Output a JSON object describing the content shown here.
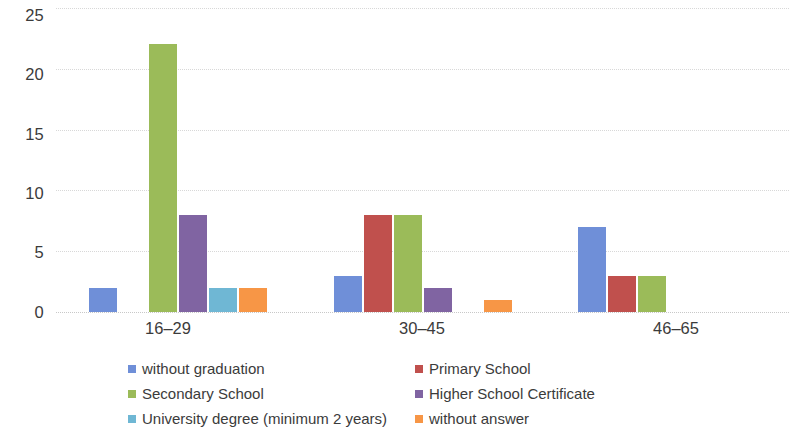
{
  "chart_data": {
    "type": "bar",
    "title": "",
    "subtitle": "",
    "xlabel": "",
    "ylabel": "",
    "categories": [
      "16–29",
      "30–45",
      "46–65"
    ],
    "ylim": [
      0,
      25
    ],
    "yticks": [
      0,
      5,
      10,
      15,
      20,
      25
    ],
    "ytick_labels": [
      "0",
      "5",
      "10",
      "15",
      "20",
      "25"
    ],
    "grid": true,
    "grid_axis": "y",
    "legend_position": "bottom",
    "series": [
      {
        "name": "without graduation",
        "color": "#6f8fd8",
        "values": [
          2,
          3,
          7
        ]
      },
      {
        "name": "Primary School",
        "color": "#c0504d",
        "values": [
          0,
          8,
          3
        ]
      },
      {
        "name": "Secondary School",
        "color": "#9bbb59",
        "values": [
          22,
          8,
          3
        ]
      },
      {
        "name": "Higher School Certificate",
        "color": "#8064a2",
        "values": [
          8,
          2,
          0
        ]
      },
      {
        "name": "University degree (minimum 2 years)",
        "color": "#6fb7d4",
        "values": [
          2,
          0,
          0
        ]
      },
      {
        "name": "without answer",
        "color": "#f79646",
        "values": [
          2,
          1,
          0
        ]
      }
    ]
  },
  "axis": {
    "y_tick_0": "0",
    "y_tick_1": "5",
    "y_tick_2": "10",
    "y_tick_3": "15",
    "y_tick_4": "20",
    "y_tick_5": "25"
  },
  "categories": {
    "cat_0": "16–29",
    "cat_1": "30–45",
    "cat_2": "46–65"
  },
  "legend": {
    "item_0": "without graduation",
    "item_1": "Primary School",
    "item_2": "Secondary School",
    "item_3": "Higher School Certificate",
    "item_4": "University degree (minimum 2 years)",
    "item_5": "without answer"
  },
  "colors": {
    "series_blue": "#6f8fd8",
    "series_red": "#c0504d",
    "series_green": "#9bbb59",
    "series_purple": "#8064a2",
    "series_lightblue": "#6fb7d4",
    "series_orange": "#f79646",
    "gridline": "#d8d8d8",
    "text": "#3b3b3b",
    "background": "#ffffff"
  }
}
